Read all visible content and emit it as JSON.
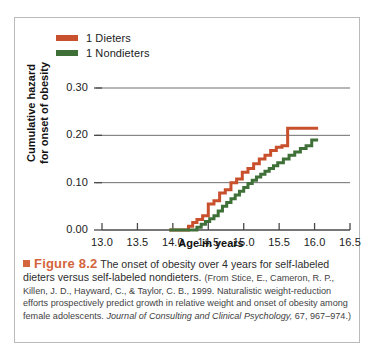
{
  "figure": {
    "bullet_icon": "square-bullet-icon",
    "number_label": "Figure 8.2",
    "lead_text": " The onset of obesity over 4 years for self-labeled dieters versus self-labeled nondieters. ",
    "source_open": "(From Stice, E., Cameron, R. P., Killen, J. D., Hayward, C., & Taylor, C. B., 1999. Naturalistic weight-reduction efforts prospectively predict growth in relative weight and onset of obesity among female adolescents. ",
    "source_italic": "Journal of Consulting and Clinical Psychology,",
    "source_close": " 67, 967–974.)"
  },
  "colors": {
    "dieters": "#c8502d",
    "nondieters": "#3f7038",
    "accent": "#d4643c",
    "axis": "#4a4a4a",
    "grid": "#6e6e6e",
    "frame": "#b9babc"
  },
  "chart_data": {
    "type": "line",
    "title": "",
    "xlabel": "Age in years",
    "ylabel": "Cumulative hazard for onset of obesity",
    "ylabel_line1": "Cumulative hazard",
    "ylabel_line2": "for onset of obesity",
    "xlim": [
      13.0,
      16.5
    ],
    "ylim": [
      0.0,
      0.3
    ],
    "xticks": [
      "13.0",
      "13.5",
      "14.0",
      "14.5",
      "15.0",
      "15.5",
      "16.0",
      "16.5"
    ],
    "xtick_values": [
      13.0,
      13.5,
      14.0,
      14.5,
      15.0,
      15.5,
      16.0,
      16.5
    ],
    "yticks": [
      "0.00",
      "0.10",
      "0.20",
      "0.30"
    ],
    "ytick_values": [
      0.0,
      0.1,
      0.2,
      0.3
    ],
    "grid": "horizontal",
    "legend_position": "top-left",
    "step_style": "post",
    "series": [
      {
        "name": "1 Dieters",
        "color": "#c8502d",
        "x": [
          13.95,
          14.18,
          14.22,
          14.28,
          14.34,
          14.42,
          14.5,
          14.58,
          14.66,
          14.74,
          14.82,
          14.9,
          14.98,
          15.06,
          15.14,
          15.22,
          15.3,
          15.38,
          15.46,
          15.54,
          15.62,
          16.05
        ],
        "values": [
          0.0,
          0.0,
          0.008,
          0.016,
          0.022,
          0.03,
          0.055,
          0.062,
          0.078,
          0.085,
          0.1,
          0.108,
          0.122,
          0.13,
          0.14,
          0.15,
          0.158,
          0.168,
          0.175,
          0.178,
          0.215,
          0.215
        ]
      },
      {
        "name": "1 Nondieters",
        "color": "#3f7038",
        "x": [
          13.95,
          14.28,
          14.34,
          14.4,
          14.46,
          14.52,
          14.58,
          14.64,
          14.7,
          14.76,
          14.82,
          14.88,
          14.94,
          15.0,
          15.06,
          15.12,
          15.18,
          15.24,
          15.3,
          15.36,
          15.42,
          15.48,
          15.56,
          15.64,
          15.72,
          15.8,
          15.88,
          15.96,
          16.05
        ],
        "values": [
          0.0,
          0.0,
          0.006,
          0.012,
          0.018,
          0.024,
          0.03,
          0.04,
          0.05,
          0.058,
          0.066,
          0.074,
          0.082,
          0.09,
          0.098,
          0.105,
          0.112,
          0.118,
          0.124,
          0.13,
          0.136,
          0.142,
          0.15,
          0.158,
          0.165,
          0.172,
          0.178,
          0.19,
          0.19
        ]
      }
    ],
    "legend": [
      {
        "label": "1 Dieters",
        "color": "#c8502d"
      },
      {
        "label": "1 Nondieters",
        "color": "#3f7038"
      }
    ]
  }
}
